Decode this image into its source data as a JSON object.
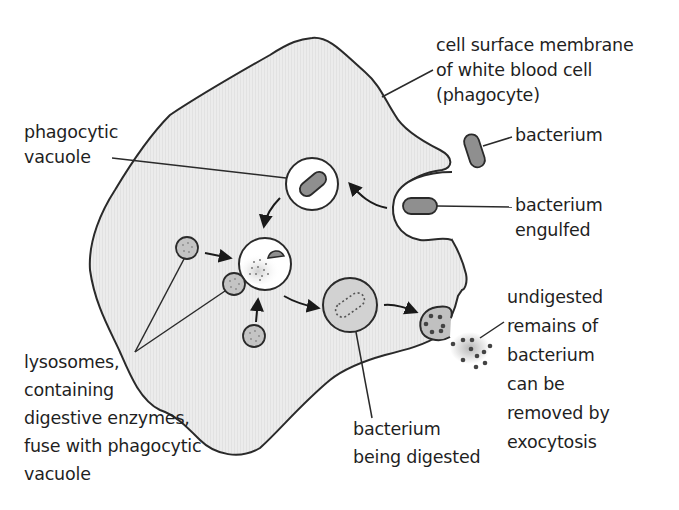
{
  "diagram": {
    "colors": {
      "cytoplasm": "#ebebeb",
      "outline": "#2a2a2a",
      "bacterium": "#8f8f8f",
      "lysosome": "#c4c4c4",
      "digesting_vacuole": "#d2d2d2",
      "vacuole": "#ffffff",
      "dots": "#555555",
      "text": "#1f1f1f"
    },
    "labels": {
      "membrane": [
        "cell surface membrane",
        "of white blood cell",
        "(phagocyte)"
      ],
      "phagocytic_vacuole": [
        "phagocytic",
        "vacuole"
      ],
      "bacterium": [
        "bacterium"
      ],
      "bacterium_engulfed": [
        "bacterium",
        "engulfed"
      ],
      "undigested_remains": [
        "undigested",
        "remains of",
        "bacterium",
        "can be",
        "removed by",
        "exocytosis"
      ],
      "lysosomes": [
        "lysosomes,",
        "containing",
        "digestive enzymes,",
        "fuse with phagocytic",
        "vacuole"
      ],
      "being_digested": [
        "bacterium",
        "being digested"
      ]
    }
  }
}
